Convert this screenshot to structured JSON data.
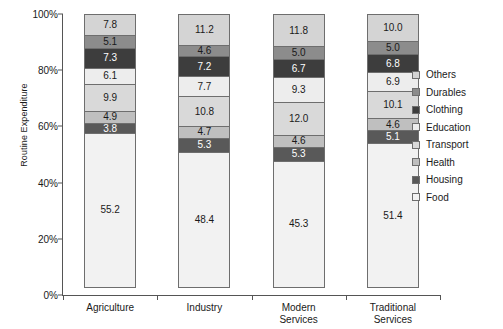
{
  "chart_data": {
    "type": "bar",
    "stacked": true,
    "stack_mode": "percent",
    "title": "",
    "xlabel": "",
    "ylabel": "Routine Expenditure",
    "ylim": [
      0,
      100
    ],
    "ytick_labels": [
      "0%",
      "20%",
      "40%",
      "60%",
      "80%",
      "100%"
    ],
    "ytick_values": [
      0,
      20,
      40,
      60,
      80,
      100
    ],
    "grid": false,
    "legend_position": "right",
    "categories": [
      "Agriculture",
      "Industry",
      "Modern Services",
      "Traditional Services"
    ],
    "category_lines": [
      [
        "Agriculture"
      ],
      [
        "Industry"
      ],
      [
        "Modern",
        "Services"
      ],
      [
        "Traditional",
        "Services"
      ]
    ],
    "series": [
      {
        "name": "Food",
        "color": "#f2f2f2",
        "values": [
          55.2,
          48.4,
          45.3,
          51.4
        ]
      },
      {
        "name": "Housing",
        "color": "#595959",
        "values": [
          3.8,
          5.3,
          5.3,
          5.1
        ]
      },
      {
        "name": "Health",
        "color": "#bfbfbf",
        "values": [
          4.9,
          4.7,
          4.6,
          4.6
        ]
      },
      {
        "name": "Transport",
        "color": "#d9d9d9",
        "values": [
          9.9,
          10.8,
          12.0,
          10.1
        ]
      },
      {
        "name": "Education",
        "color": "#ededed",
        "values": [
          6.1,
          7.7,
          9.3,
          6.9
        ]
      },
      {
        "name": "Clothing",
        "color": "#3d3d3d",
        "values": [
          7.3,
          7.2,
          6.7,
          6.8
        ]
      },
      {
        "name": "Durables",
        "color": "#8c8c8c",
        "values": [
          5.1,
          4.6,
          5.0,
          5.0
        ]
      },
      {
        "name": "Others",
        "color": "#d4d4d4",
        "values": [
          7.8,
          11.2,
          11.8,
          10.0
        ]
      }
    ],
    "legend_order_top_to_bottom": [
      "Others",
      "Durables",
      "Clothing",
      "Education",
      "Transport",
      "Health",
      "Housing",
      "Food"
    ]
  }
}
